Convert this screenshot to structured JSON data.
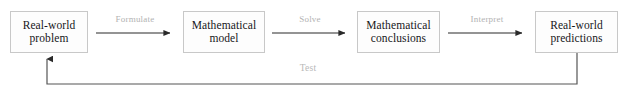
{
  "diagram": {
    "type": "flowchart",
    "colors": {
      "background": "#ffffff",
      "box_fill": "#fdfdfd",
      "box_border": "#c8c8c8",
      "box_text": "#17171a",
      "arrow": "#2a2a2a",
      "edge_label_text": "#b2b2b2",
      "loop_line": "#555555"
    },
    "nodes": [
      {
        "id": "real-world-problem",
        "line1": "Real-world",
        "line2": "problem",
        "x": 10,
        "y": 11,
        "w": 78,
        "h": 42
      },
      {
        "id": "mathematical-model",
        "line1": "Mathematical",
        "line2": "model",
        "x": 183,
        "y": 11,
        "w": 82,
        "h": 42
      },
      {
        "id": "mathematical-conclusions",
        "line1": "Mathematical",
        "line2": "conclusions",
        "x": 357,
        "y": 11,
        "w": 83,
        "h": 42
      },
      {
        "id": "real-world-predictions",
        "line1": "Real-world",
        "line2": "predictions",
        "x": 535,
        "y": 11,
        "w": 83,
        "h": 42
      }
    ],
    "edges": [
      {
        "id": "formulate",
        "label": "Formulate",
        "from": "real-world-problem",
        "to": "mathematical-model",
        "label_x": 96,
        "label_y": 14,
        "label_w": 78,
        "x1": 96,
        "x2": 172,
        "y": 33
      },
      {
        "id": "solve",
        "label": "Solve",
        "from": "mathematical-model",
        "to": "mathematical-conclusions",
        "label_x": 272,
        "label_y": 14,
        "label_w": 76,
        "x1": 272,
        "x2": 347,
        "y": 33
      },
      {
        "id": "interpret",
        "label": "Interpret",
        "from": "mathematical-conclusions",
        "to": "real-world-predictions",
        "label_x": 448,
        "label_y": 14,
        "label_w": 78,
        "x1": 448,
        "x2": 524,
        "y": 33
      }
    ],
    "feedback_edge": {
      "id": "test",
      "label": "Test",
      "from": "real-world-predictions",
      "to": "real-world-problem",
      "label_x": 288,
      "label_y": 63,
      "label_w": 40,
      "down_x": 577,
      "down_y1": 53,
      "down_y2": 84,
      "across_y": 84,
      "across_x1": 577,
      "across_x2": 47,
      "up_x": 47,
      "up_y1": 84,
      "up_y2": 57
    }
  }
}
